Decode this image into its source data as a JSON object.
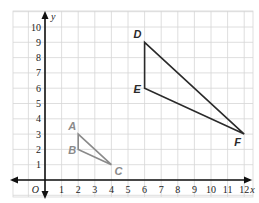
{
  "chart_data": {
    "type": "coordinate-grid",
    "xlabel": "x",
    "ylabel": "y",
    "origin_label": "O",
    "xlim": [
      0,
      12
    ],
    "ylim": [
      0,
      10
    ],
    "x_ticks": [
      "1",
      "2",
      "3",
      "4",
      "5",
      "6",
      "7",
      "8",
      "9",
      "10",
      "11",
      "12"
    ],
    "y_ticks": [
      "1",
      "2",
      "3",
      "4",
      "5",
      "6",
      "7",
      "8",
      "9",
      "10"
    ],
    "grid": true,
    "shapes": [
      {
        "name": "triangle ABC",
        "color": "#8a8a8a",
        "points": [
          {
            "label": "A",
            "x": 2,
            "y": 3
          },
          {
            "label": "B",
            "x": 2,
            "y": 2
          },
          {
            "label": "C",
            "x": 4,
            "y": 1
          }
        ]
      },
      {
        "name": "triangle DEF",
        "color": "#2a2a2a",
        "points": [
          {
            "label": "D",
            "x": 6,
            "y": 9
          },
          {
            "label": "E",
            "x": 6,
            "y": 6
          },
          {
            "label": "F",
            "x": 12,
            "y": 3
          }
        ]
      }
    ]
  },
  "colors": {
    "grid": "#d6d6d6",
    "axis": "#111111",
    "small_triangle": "#8a8a8a",
    "large_triangle": "#2a2a2a"
  }
}
